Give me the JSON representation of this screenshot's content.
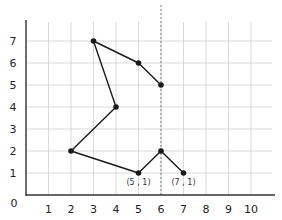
{
  "chart_data": {
    "type": "line",
    "title": "",
    "xlabel": "",
    "ylabel": "",
    "xlim": [
      0,
      10
    ],
    "ylim": [
      0,
      7
    ],
    "grid": true,
    "origin_label": "0",
    "x_ticks": [
      "1",
      "2",
      "3",
      "4",
      "5",
      "6",
      "7",
      "8",
      "9",
      "10"
    ],
    "y_ticks": [
      "1",
      "2",
      "3",
      "4",
      "5",
      "6",
      "7"
    ],
    "series": [
      {
        "name": "polyline",
        "color": "#1a1a1a",
        "points": [
          {
            "x": 6,
            "y": 5
          },
          {
            "x": 5,
            "y": 6
          },
          {
            "x": 3,
            "y": 7
          },
          {
            "x": 4,
            "y": 4
          },
          {
            "x": 2,
            "y": 2
          },
          {
            "x": 5,
            "y": 1
          },
          {
            "x": 6,
            "y": 2
          },
          {
            "x": 7,
            "y": 1
          }
        ]
      }
    ],
    "reference_lines": [
      {
        "orientation": "vertical",
        "x": 6,
        "style": "dotted",
        "color": "#888888"
      }
    ],
    "annotations": [
      {
        "text": "(5 , 1)",
        "x": 5,
        "y": 1
      },
      {
        "text": "(7 , 1)",
        "x": 7,
        "y": 1
      }
    ],
    "legend": null
  }
}
